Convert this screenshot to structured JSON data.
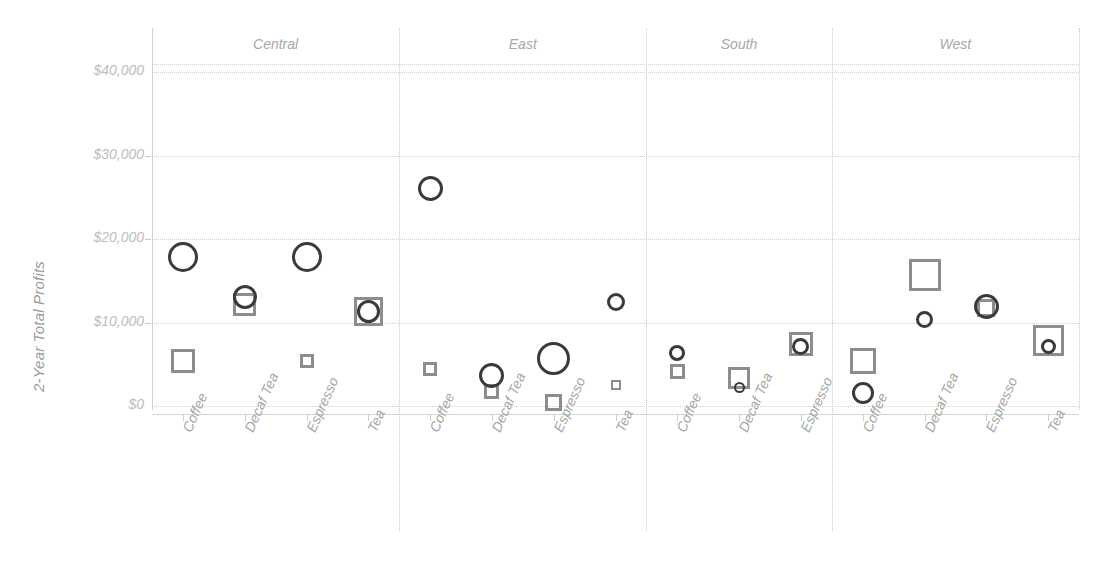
{
  "chart_data": {
    "type": "scatter",
    "title": "",
    "xlabel": "",
    "ylabel": "2-Year Total Profits",
    "ylim": [
      0,
      40000
    ],
    "yticks": [
      0,
      10000,
      20000,
      30000,
      40000
    ],
    "ytick_labels": [
      "$0",
      "$10,000",
      "$20,000",
      "$30,000",
      "$40,000"
    ],
    "grid": true,
    "legend": "none",
    "panel_variable": "Region",
    "panels": [
      "Central",
      "East",
      "South",
      "West"
    ],
    "categories": [
      "Coffee",
      "Decaf Tea",
      "Espresso",
      "Tea"
    ],
    "series": [
      {
        "name": "Circle measure",
        "marker": "circle",
        "color": "#3a3a3a",
        "points": [
          {
            "panel": "Central",
            "category": "Coffee",
            "value": 17800,
            "size": 30
          },
          {
            "panel": "Central",
            "category": "Decaf Tea",
            "value": 13000,
            "size": 24
          },
          {
            "panel": "Central",
            "category": "Espresso",
            "value": 17900,
            "size": 30
          },
          {
            "panel": "Central",
            "category": "Tea",
            "value": 11300,
            "size": 23
          },
          {
            "panel": "East",
            "category": "Coffee",
            "value": 26000,
            "size": 25
          },
          {
            "panel": "East",
            "category": "Decaf Tea",
            "value": 3700,
            "size": 25
          },
          {
            "panel": "East",
            "category": "Espresso",
            "value": 5700,
            "size": 33
          },
          {
            "panel": "East",
            "category": "Tea",
            "value": 12400,
            "size": 18
          },
          {
            "panel": "South",
            "category": "Coffee",
            "value": 6400,
            "size": 16
          },
          {
            "panel": "South",
            "category": "Decaf Tea",
            "value": 2200,
            "size": 11
          },
          {
            "panel": "South",
            "category": "Espresso",
            "value": 7100,
            "size": 17
          },
          {
            "panel": "West",
            "category": "Coffee",
            "value": 1500,
            "size": 22
          },
          {
            "panel": "West",
            "category": "Decaf Tea",
            "value": 10300,
            "size": 17
          },
          {
            "panel": "West",
            "category": "Espresso",
            "value": 11900,
            "size": 25
          },
          {
            "panel": "West",
            "category": "Tea",
            "value": 7100,
            "size": 15
          }
        ]
      },
      {
        "name": "Square measure",
        "marker": "square",
        "color": "#8d8d8d",
        "points": [
          {
            "panel": "Central",
            "category": "Coffee",
            "value": 5400,
            "size": 24
          },
          {
            "panel": "Central",
            "category": "Decaf Tea",
            "value": 12200,
            "size": 23
          },
          {
            "panel": "Central",
            "category": "Espresso",
            "value": 5400,
            "size": 14
          },
          {
            "panel": "Central",
            "category": "Tea",
            "value": 11300,
            "size": 29
          },
          {
            "panel": "East",
            "category": "Coffee",
            "value": 4400,
            "size": 14
          },
          {
            "panel": "East",
            "category": "Decaf Tea",
            "value": 1700,
            "size": 15
          },
          {
            "panel": "East",
            "category": "Espresso",
            "value": 400,
            "size": 17
          },
          {
            "panel": "East",
            "category": "Tea",
            "value": 2500,
            "size": 10
          },
          {
            "panel": "South",
            "category": "Coffee",
            "value": 4100,
            "size": 15
          },
          {
            "panel": "South",
            "category": "Decaf Tea",
            "value": 3400,
            "size": 22
          },
          {
            "panel": "South",
            "category": "Espresso",
            "value": 7400,
            "size": 24
          },
          {
            "panel": "West",
            "category": "Coffee",
            "value": 5400,
            "size": 26
          },
          {
            "panel": "West",
            "category": "Decaf Tea",
            "value": 15700,
            "size": 32
          },
          {
            "panel": "West",
            "category": "Espresso",
            "value": 11700,
            "size": 18
          },
          {
            "panel": "West",
            "category": "Tea",
            "value": 7800,
            "size": 31
          }
        ]
      }
    ],
    "panel_categories": {
      "Central": [
        "Coffee",
        "Decaf Tea",
        "Espresso",
        "Tea"
      ],
      "East": [
        "Coffee",
        "Decaf Tea",
        "Espresso",
        "Tea"
      ],
      "South": [
        "Coffee",
        "Decaf Tea",
        "Espresso"
      ],
      "West": [
        "Coffee",
        "Decaf Tea",
        "Espresso",
        "Tea"
      ]
    }
  },
  "colors": {
    "circle_stroke": "#3a3a3a",
    "square_stroke": "#8d8d8d",
    "grid": "#cfcfcf",
    "tick_text": "#bdbdbd",
    "header_text": "#a8a8a8",
    "axis_title": "#9a9a9a",
    "background": "#ffffff"
  }
}
